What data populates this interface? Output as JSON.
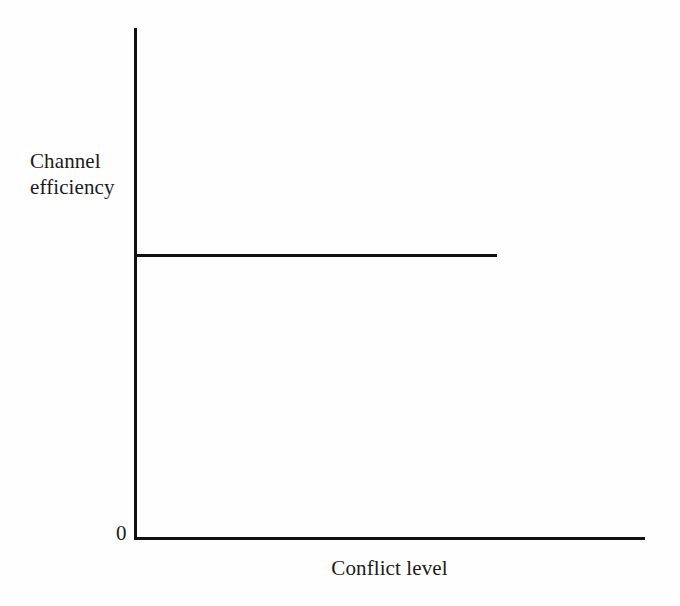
{
  "figure": {
    "background_color": "#fefefe",
    "ink_color": "#111111"
  },
  "chart_data": {
    "type": "line",
    "title": "",
    "xlabel": "Conflict level",
    "ylabel": "Channel efficiency",
    "ylabel_lines": [
      "Channel",
      "efficiency"
    ],
    "origin_label": "0",
    "grid": false,
    "legend": "none",
    "axis": {
      "x_tick_labels": [
        "0"
      ],
      "y_tick_labels": [],
      "xlim": [
        0,
        1
      ],
      "ylim": [
        0,
        1
      ]
    },
    "series": [
      {
        "name": "Channel efficiency",
        "style": "solid",
        "color": "#111111",
        "x": [
          0.0,
          0.71
        ],
        "values": [
          0.554,
          0.554
        ]
      }
    ],
    "annotations": []
  }
}
